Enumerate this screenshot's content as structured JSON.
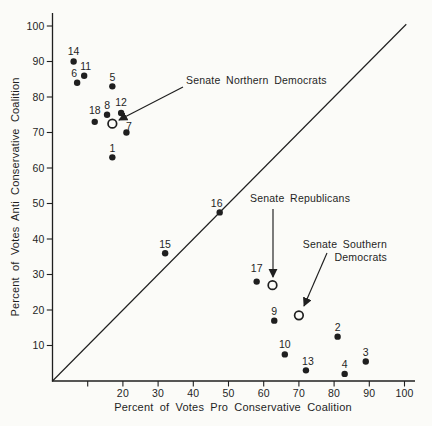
{
  "chart_data": {
    "type": "scatter",
    "title": "",
    "xlabel": "Percent of Votes Pro Conservative Coalition",
    "ylabel": "Percent of Votes Anti Conservative Coalition",
    "xlim": [
      0,
      103
    ],
    "ylim": [
      0,
      103
    ],
    "grid": false,
    "ink_color": "#1f1f1f",
    "background_color": "#fbfbf8",
    "x_ticks": [
      {
        "value": 10,
        "label": ""
      },
      {
        "value": 20,
        "label": "20"
      },
      {
        "value": 30,
        "label": "30"
      },
      {
        "value": 40,
        "label": "40"
      },
      {
        "value": 50,
        "label": "50"
      },
      {
        "value": 60,
        "label": "60"
      },
      {
        "value": 70,
        "label": "70"
      },
      {
        "value": 80,
        "label": "80"
      },
      {
        "value": 90,
        "label": "90"
      },
      {
        "value": 100,
        "label": "100"
      }
    ],
    "y_ticks": [
      {
        "value": 10,
        "label": "10"
      },
      {
        "value": 20,
        "label": "20"
      },
      {
        "value": 30,
        "label": "30"
      },
      {
        "value": 40,
        "label": "40"
      },
      {
        "value": 50,
        "label": "50"
      },
      {
        "value": 60,
        "label": "60"
      },
      {
        "value": 70,
        "label": "70"
      },
      {
        "value": 80,
        "label": "80"
      },
      {
        "value": 90,
        "label": "90"
      },
      {
        "value": 100,
        "label": "100"
      }
    ],
    "identity_line": {
      "x1": 0,
      "y1": 0,
      "x2": 100.5,
      "y2": 100.5
    },
    "points": [
      {
        "label": "1",
        "x": 17,
        "y": 63
      },
      {
        "label": "2",
        "x": 81,
        "y": 12.5
      },
      {
        "label": "3",
        "x": 89,
        "y": 5.5
      },
      {
        "label": "4",
        "x": 83,
        "y": 2
      },
      {
        "label": "5",
        "x": 17,
        "y": 83
      },
      {
        "label": "6",
        "x": 7,
        "y": 84,
        "dx": -3
      },
      {
        "label": "7",
        "x": 21,
        "y": 70,
        "dx": 2.5,
        "dy": 2.5
      },
      {
        "label": "8",
        "x": 15.5,
        "y": 75
      },
      {
        "label": "9",
        "x": 63,
        "y": 17
      },
      {
        "label": "10",
        "x": 66,
        "y": 7.5,
        "dy": -1
      },
      {
        "label": "11",
        "x": 9,
        "y": 86,
        "dx": 1.5
      },
      {
        "label": "12",
        "x": 19.5,
        "y": 75.5,
        "dy": -1
      },
      {
        "label": "13",
        "x": 72,
        "y": 3,
        "dx": 2
      },
      {
        "label": "14",
        "x": 6,
        "y": 90,
        "dy": -1
      },
      {
        "label": "15",
        "x": 32,
        "y": 36
      },
      {
        "label": "16",
        "x": 47.5,
        "y": 47.5,
        "dx": -3
      },
      {
        "label": "17",
        "x": 58,
        "y": 28,
        "dy": -4
      },
      {
        "label": "18",
        "x": 12,
        "y": 73,
        "dy": -2
      }
    ],
    "group_means": [
      {
        "group": "Senate Northern Democrats",
        "x": 17,
        "y": 72.5
      },
      {
        "group": "Senate Republicans",
        "x": 62.5,
        "y": 27
      },
      {
        "group": "Senate Southern Democrats",
        "x": 70,
        "y": 18.5
      }
    ],
    "annotations": [
      {
        "id": "senate-northern-democrats",
        "lines": [
          "Senate Northern Democrats"
        ],
        "text_x": 186,
        "text_y": 84,
        "align": "start",
        "line_height": 13,
        "arrow": {
          "x1": 183,
          "y1": 87,
          "x2": 119,
          "y2": 120
        }
      },
      {
        "id": "senate-republicans",
        "lines": [
          "Senate Republicans"
        ],
        "text_x": 250,
        "text_y": 202,
        "align": "start",
        "line_height": 13,
        "arrow": {
          "x1": 273,
          "y1": 209,
          "x2": 273,
          "y2": 277
        }
      },
      {
        "id": "senate-southern-democrats",
        "lines": [
          "Senate Southern",
          "Democrats"
        ],
        "text_x": 387,
        "text_y": 248,
        "align": "end",
        "line_height": 13,
        "arrow": {
          "x1": 327,
          "y1": 253,
          "x2": 304,
          "y2": 306
        }
      }
    ]
  }
}
